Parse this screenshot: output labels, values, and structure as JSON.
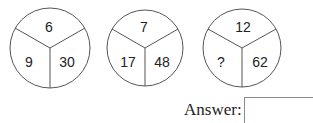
{
  "puzzle": {
    "circles": [
      {
        "top": "6",
        "left": "9",
        "right": "30"
      },
      {
        "top": "7",
        "left": "17",
        "right": "48"
      },
      {
        "top": "12",
        "left": "?",
        "right": "62"
      }
    ]
  },
  "answer": {
    "label": "Answer:",
    "value": ""
  },
  "colors": {
    "stroke": "#555555",
    "text": "#222222"
  }
}
